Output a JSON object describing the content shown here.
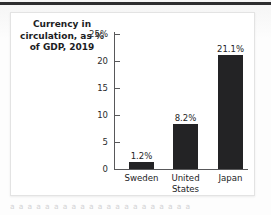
{
  "page": {
    "background_color": "#fbfbfb",
    "rule_color": "#2c2c2e",
    "undertext": "a a a a a a a a a a a a a a a a a a a a a"
  },
  "figure": {
    "card_background": "#ffffff",
    "border_color": "#e3e3e3"
  },
  "chart_data": {
    "type": "bar",
    "title": "Currency in circulation, as % of GDP, 2019",
    "xlabel": "",
    "ylabel": "",
    "categories": [
      "Sweden",
      "United States",
      "Japan"
    ],
    "values": [
      1.2,
      8.2,
      21.1
    ],
    "data_labels": [
      "1.2%",
      "8.2%",
      "21.1%"
    ],
    "ylim": [
      0,
      25
    ],
    "yticks": [
      0,
      5,
      10,
      15,
      20,
      25
    ],
    "ytick_labels": [
      "0",
      "5",
      "10",
      "15",
      "20",
      "25%"
    ],
    "grid": false,
    "legend": false,
    "bar_color": "#232325",
    "axis_color": "#58585a",
    "text_color": "#232325"
  }
}
